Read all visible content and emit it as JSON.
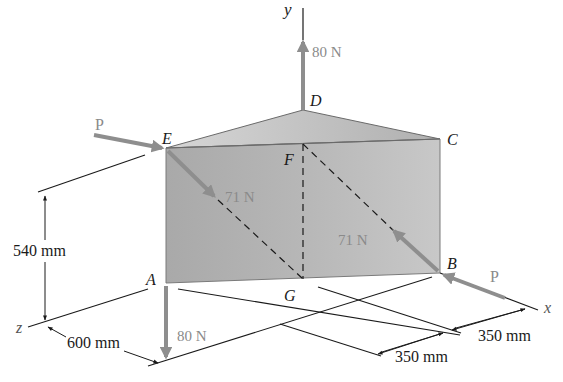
{
  "figure": {
    "points": {
      "A": "A",
      "B": "B",
      "C": "C",
      "D": "D",
      "E": "E",
      "F": "F",
      "G": "G"
    },
    "axes": {
      "x": "x",
      "y": "y",
      "z": "z"
    },
    "forces": {
      "top": "80 N",
      "bottom": "80 N",
      "diag_left": "71 N",
      "diag_right": "71 N",
      "P_left": "P",
      "P_right": "P"
    },
    "dimensions": {
      "height": "540 mm",
      "depth": "600 mm",
      "x_near": "350 mm",
      "x_far": "350 mm"
    },
    "colors": {
      "front_face": "#b4b4b4",
      "top_face": "#c9c9c9",
      "force_arrow": "#8e8e8e",
      "force_label": "#8a8a8a",
      "line": "#1a1a1a"
    }
  }
}
